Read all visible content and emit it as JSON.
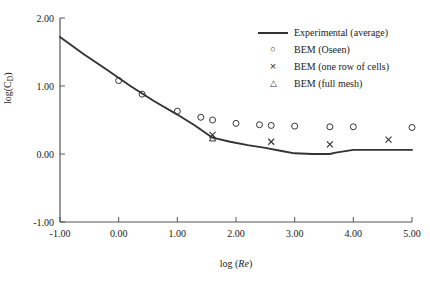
{
  "figure": {
    "width": 430,
    "height": 287,
    "background": "#ffffff",
    "line_color": "#333333",
    "marker_color": "#333333",
    "axis_color": "#555555",
    "text_color": "#1a1a1a"
  },
  "axes": {
    "x_title_prefix": "log (",
    "x_title_italic": "Re",
    "x_title_suffix": ")",
    "x_title_full": "log (Re)",
    "y_title_prefix": "log(C",
    "y_title_sub": "D",
    "y_title_suffix": ")",
    "y_title_full": "log(CD)",
    "x_ticks": [
      "-1.00",
      "0.00",
      "1.00",
      "2.00",
      "3.00",
      "4.00",
      "5.00"
    ],
    "y_ticks": [
      "-1.00",
      "0.00",
      "1.00",
      "2.00"
    ]
  },
  "legend": {
    "entries": [
      {
        "marker": "line",
        "label": "Experimental (average)"
      },
      {
        "marker": "circle",
        "label": "BEM (Oseen)"
      },
      {
        "marker": "cross",
        "label": "BEM (one row of cells)"
      },
      {
        "marker": "triangle",
        "label": "BEM (full mesh)"
      }
    ]
  },
  "chart_data": {
    "type": "line",
    "title": "",
    "xlabel": "log (Re)",
    "ylabel": "log(CD)",
    "xlim": [
      -1.0,
      5.0
    ],
    "ylim": [
      -1.0,
      2.0
    ],
    "xticks": [
      -1.0,
      0.0,
      1.0,
      2.0,
      3.0,
      4.0,
      5.0
    ],
    "yticks": [
      -1.0,
      0.0,
      1.0,
      2.0
    ],
    "grid": false,
    "legend_position": "upper right",
    "series": [
      {
        "name": "Experimental (average)",
        "marker": "line",
        "x": [
          -1.0,
          -0.6,
          -0.2,
          0.2,
          0.6,
          1.0,
          1.3,
          1.6,
          1.9,
          2.2,
          2.5,
          2.8,
          3.0,
          3.3,
          3.6,
          3.7,
          4.0,
          4.5,
          5.0
        ],
        "y": [
          1.72,
          1.47,
          1.24,
          1.0,
          0.78,
          0.58,
          0.42,
          0.24,
          0.18,
          0.13,
          0.09,
          0.04,
          0.01,
          0.0,
          0.0,
          0.02,
          0.06,
          0.06,
          0.06
        ]
      },
      {
        "name": "BEM (Oseen)",
        "marker": "circle",
        "x": [
          0.0,
          0.4,
          1.0,
          1.4,
          1.6,
          2.0,
          2.4,
          2.6,
          3.0,
          3.6,
          4.0,
          5.0
        ],
        "y": [
          1.08,
          0.88,
          0.63,
          0.54,
          0.5,
          0.45,
          0.43,
          0.42,
          0.41,
          0.4,
          0.4,
          0.39
        ]
      },
      {
        "name": "BEM (one row of cells)",
        "marker": "cross",
        "x": [
          1.6,
          2.6,
          3.6,
          4.6
        ],
        "y": [
          0.28,
          0.18,
          0.14,
          0.21
        ]
      },
      {
        "name": "BEM (full mesh)",
        "marker": "triangle",
        "x": [
          1.6
        ],
        "y": [
          0.23
        ]
      }
    ]
  }
}
